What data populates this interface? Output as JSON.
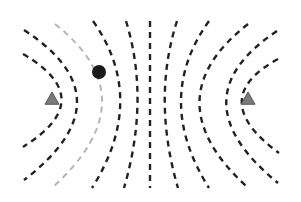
{
  "diagram": {
    "colors": {
      "background": "#ffffff",
      "line": "#222222",
      "highlight_line": "#b5b5b5",
      "triangle_fill": "#7a7a7a",
      "triangle_stroke": "#555555",
      "point": "#1a1a1a"
    },
    "markers": [
      {
        "name": "left-triangle",
        "shape": "triangle",
        "x": 52,
        "y": 99
      },
      {
        "name": "right-triangle",
        "shape": "triangle",
        "x": 248,
        "y": 99
      }
    ],
    "point": {
      "name": "dot",
      "x": 99,
      "y": 72,
      "r": 7
    },
    "curves": [
      {
        "name": "left-outer",
        "d": "M23,54 Q100,99 23,147",
        "highlight": false
      },
      {
        "name": "left-2",
        "d": "M24,30 Q130,99 24,180",
        "highlight": false
      },
      {
        "name": "left-highlight",
        "d": "M55,24 Q150,99 53,187",
        "highlight": true
      },
      {
        "name": "left-4",
        "d": "M93,21 Q148,99 92,188",
        "highlight": false
      },
      {
        "name": "left-5",
        "d": "M126,21 Q150,99 124,188",
        "highlight": false
      },
      {
        "name": "center",
        "d": "M150,21 L150,188",
        "highlight": false
      },
      {
        "name": "right-5",
        "d": "M177,21 Q152,99 178,188",
        "highlight": false
      },
      {
        "name": "right-4",
        "d": "M209,21 Q153,99 209,188",
        "highlight": false
      },
      {
        "name": "right-3",
        "d": "M248,24 Q152,99 246,186",
        "highlight": false
      },
      {
        "name": "right-2",
        "d": "M277,31 Q175,99 278,183",
        "highlight": false
      },
      {
        "name": "right-outer",
        "d": "M278,59 Q205,99 279,153",
        "highlight": false
      }
    ]
  }
}
